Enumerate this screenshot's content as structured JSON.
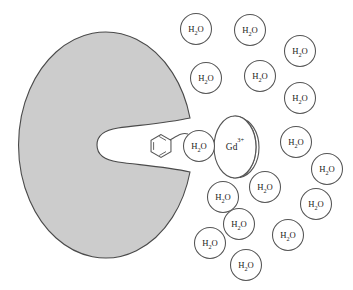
{
  "figure": {
    "background_color": "#ffffff",
    "width": 353,
    "height": 290
  },
  "protein": {
    "name": "protein-macromolecule",
    "fill_color": "#cccccc",
    "stroke_color": "#4a4a4a",
    "center_x": 101,
    "center_y": 145,
    "radius_x": 87,
    "radius_y": 113,
    "binding_pocket": {
      "name": "binding-pocket-cleft",
      "tip_x": 97,
      "mouth_x": 190,
      "mouth_top_y": 118,
      "mouth_bottom_y": 172
    }
  },
  "chelate": {
    "aryl_ring": {
      "label": "aromatic-ring",
      "center_x": 161,
      "center_y": 146,
      "radius": 11.5
    },
    "bond": {
      "label": "coordination-bond",
      "from_x": 170,
      "from_y": 140,
      "to_x": 188,
      "to_y": 134
    },
    "inner_water": {
      "label_text": "H",
      "sub_text": "2",
      "tail_text": "O",
      "center_x": 199,
      "center_y": 146,
      "radius": 15.5
    },
    "metal": {
      "label_text": "Gd",
      "sup_text": "3+",
      "center_x": 235,
      "center_y": 147,
      "radius_x": 21,
      "radius_y": 31
    }
  },
  "water_molecules": {
    "label_text": "H",
    "sub_text": "2",
    "tail_text": "O",
    "count": 18,
    "radius": 15.5,
    "positions": [
      {
        "id": "water-1",
        "x": 196,
        "y": 29
      },
      {
        "id": "water-2",
        "x": 250,
        "y": 30
      },
      {
        "id": "water-3",
        "x": 300,
        "y": 51
      },
      {
        "id": "water-4",
        "x": 206,
        "y": 78
      },
      {
        "id": "water-5",
        "x": 260,
        "y": 76
      },
      {
        "id": "water-6",
        "x": 300,
        "y": 98
      },
      {
        "id": "water-7",
        "x": 296,
        "y": 142
      },
      {
        "id": "water-8",
        "x": 327,
        "y": 169
      },
      {
        "id": "water-9",
        "x": 265,
        "y": 187
      },
      {
        "id": "water-10",
        "x": 223,
        "y": 197
      },
      {
        "id": "water-11",
        "x": 316,
        "y": 204
      },
      {
        "id": "water-12",
        "x": 239,
        "y": 224
      },
      {
        "id": "water-13",
        "x": 288,
        "y": 235
      },
      {
        "id": "water-14",
        "x": 210,
        "y": 243
      },
      {
        "id": "water-15",
        "x": 246,
        "y": 265
      }
    ]
  }
}
